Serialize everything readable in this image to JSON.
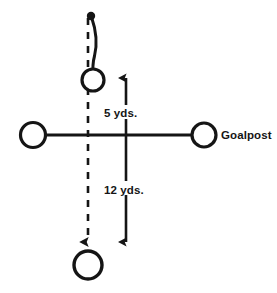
{
  "diagram": {
    "background_color": "#ffffff",
    "ink_color": "#151515",
    "labels": {
      "distance_short": "5 yds.",
      "distance_long": "12 yds.",
      "goalpost": "Goalpost"
    },
    "icon_names": {
      "ball_marker": "ball-dot-marker",
      "player_holder": "player-circle-holder",
      "player_kicker": "player-circle-kicker",
      "post_left": "goalpost-circle-left",
      "post_right": "goalpost-circle-right",
      "arrow_up": "arrow-up-5yds",
      "arrow_down": "arrow-down-12yds",
      "dashed_path": "dashed-motion-path",
      "curved_path": "curved-ball-flight-path",
      "crossbar": "goalpost-crossbar-line"
    },
    "elements": {
      "crossbar": {
        "x1": 33,
        "y1": 135,
        "x2": 204,
        "y2": 135,
        "stroke_width": 3.2
      },
      "post_left_circle": {
        "cx": 33,
        "cy": 135,
        "r": 12.5,
        "stroke_width": 3.2
      },
      "post_right_circle": {
        "cx": 204,
        "cy": 135,
        "r": 12.0,
        "stroke_width": 3.2
      },
      "holder_circle": {
        "cx": 93,
        "cy": 80,
        "r": 11.0,
        "stroke_width": 3.2
      },
      "kicker_circle": {
        "cx": 88,
        "cy": 265,
        "r": 14.0,
        "stroke_width": 3.4
      },
      "ball_dot": {
        "cx": 91,
        "cy": 16,
        "r": 4.0
      },
      "dashed_line": {
        "x": 88,
        "y_top": 18,
        "y_bottom": 244,
        "dash": "7 7",
        "stroke_width": 2.6
      },
      "measure_line": {
        "x": 126,
        "y_top": 72,
        "y_bottom": 248,
        "stroke_width": 2.6
      }
    },
    "label_positions": {
      "distance_short": {
        "x": 104,
        "y": 117
      },
      "distance_long": {
        "x": 104,
        "y": 194
      },
      "goalpost": {
        "x": 221,
        "y": 139
      }
    }
  }
}
